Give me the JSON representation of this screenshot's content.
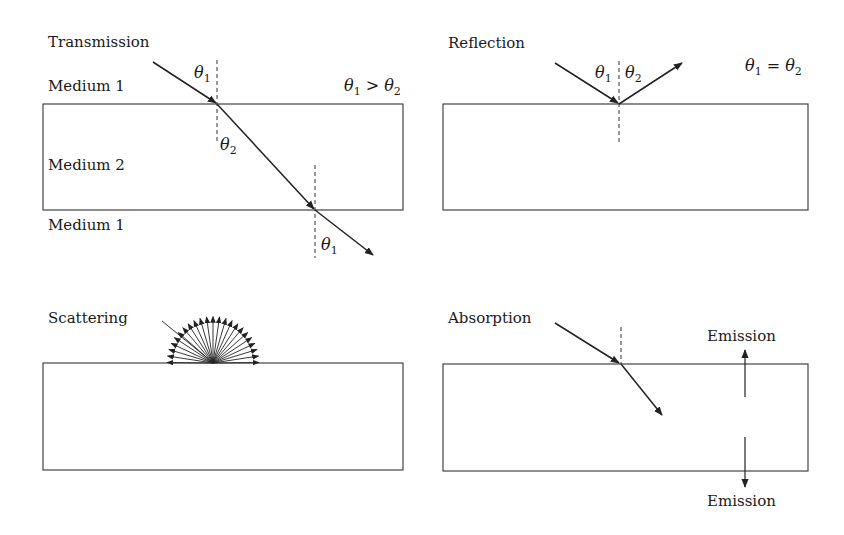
{
  "panels": {
    "transmission": {
      "title": "Transmission",
      "medium_top": "Medium 1",
      "medium_middle": "Medium 2",
      "medium_bottom": "Medium 1",
      "angle_in": {
        "sym": "θ",
        "sub": "1"
      },
      "angle_refr": {
        "sym": "θ",
        "sub": "2"
      },
      "angle_out": {
        "sym": "θ",
        "sub": "1"
      },
      "relation": {
        "a": "θ",
        "a_sub": "1",
        "op": " > ",
        "b": "θ",
        "b_sub": "2"
      }
    },
    "reflection": {
      "title": "Reflection",
      "angle_in": {
        "sym": "θ",
        "sub": "1"
      },
      "angle_out": {
        "sym": "θ",
        "sub": "2"
      },
      "relation": {
        "a": "θ",
        "a_sub": "1",
        "op": " = ",
        "b": "θ",
        "b_sub": "2"
      }
    },
    "scattering": {
      "title": "Scattering",
      "scattered_ray_count": 23
    },
    "absorption": {
      "title": "Absorption",
      "emission_up": "Emission",
      "emission_down": "Emission"
    }
  },
  "colors": {
    "line": "#333333",
    "text": "#1a1a1a",
    "background": "#ffffff"
  }
}
